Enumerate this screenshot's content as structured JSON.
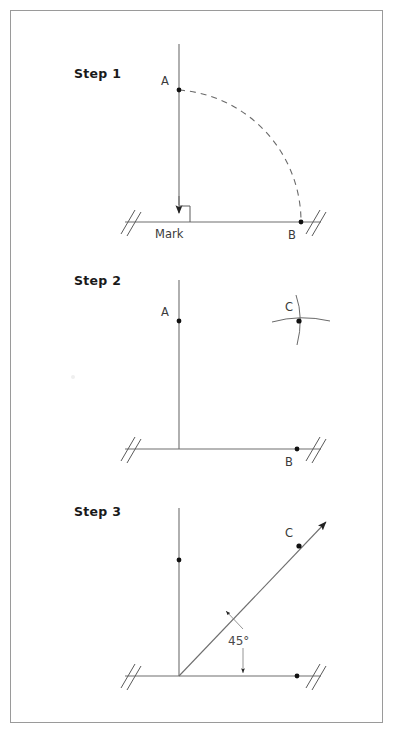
{
  "page": {
    "background_color": "#ffffff",
    "border_color": "#9a9a9a",
    "ink_color": "#6e6e6e",
    "label_color": "#1a1a1a"
  },
  "steps": [
    {
      "id": "step-1",
      "label": "Step 1",
      "points": [
        {
          "name": "A",
          "label": "A"
        },
        {
          "name": "B",
          "label": "B"
        }
      ],
      "annotations": [
        {
          "name": "mark",
          "label": "Mark"
        }
      ],
      "arc_style": "dashed",
      "has_right_angle_symbol": true,
      "has_down_arrow": true
    },
    {
      "id": "step-2",
      "label": "Step 2",
      "points": [
        {
          "name": "A",
          "label": "A"
        },
        {
          "name": "B",
          "label": "B"
        },
        {
          "name": "C",
          "label": "C"
        }
      ],
      "annotations": [],
      "arc_style": "crossing-arcs",
      "has_right_angle_symbol": false,
      "has_down_arrow": false
    },
    {
      "id": "step-3",
      "label": "Step 3",
      "points": [
        {
          "name": "C",
          "label": "C"
        }
      ],
      "annotations": [
        {
          "name": "angle-measure",
          "label": "45°"
        }
      ],
      "arc_style": "none",
      "has_right_angle_symbol": false,
      "has_down_arrow": false
    }
  ]
}
